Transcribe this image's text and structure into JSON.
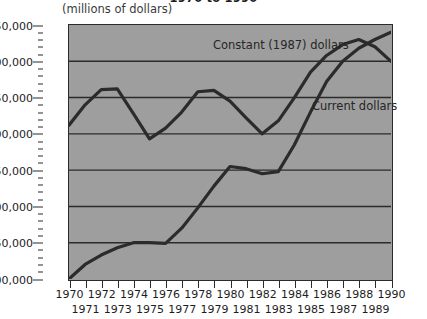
{
  "chart_data": {
    "type": "line",
    "title": "1970 to 1990",
    "subtitle": "(millions of dollars)",
    "xlabel": "",
    "ylabel": "",
    "grid": true,
    "legend_position": "inline-annotation",
    "x": [
      1970,
      1971,
      1972,
      1973,
      1974,
      1975,
      1976,
      1977,
      1978,
      1979,
      1980,
      1981,
      1982,
      1983,
      1984,
      1985,
      1986,
      1987,
      1988,
      1989,
      1990
    ],
    "xlim": [
      1970,
      1990
    ],
    "ylim": [
      100000,
      450000
    ],
    "ytick_values": [
      100000,
      150000,
      200000,
      250000,
      300000,
      350000,
      400000,
      450000
    ],
    "ytick_labels": [
      "$100,000",
      "$150,000",
      "$200,000",
      "$250,000",
      "$300,000",
      "$350,000",
      "$400,000",
      "$450,000"
    ],
    "ytick_minor_step": 10000,
    "xtick_labels_row_a": [
      "1970",
      "1972",
      "1974",
      "1976",
      "1978",
      "1980",
      "1982",
      "1984",
      "1986",
      "1988",
      "1990"
    ],
    "xtick_labels_row_b": [
      "1971",
      "1973",
      "1975",
      "1977",
      "1979",
      "1981",
      "1983",
      "1985",
      "1987",
      "1989"
    ],
    "series": [
      {
        "name": "Constant (1987) dollars",
        "color": "#2b2b2b",
        "values": [
          312000,
          340000,
          361000,
          362000,
          328000,
          293000,
          308000,
          330000,
          358000,
          360000,
          345000,
          322000,
          300000,
          318000,
          350000,
          385000,
          408000,
          423000,
          430000,
          420000,
          400000
        ]
      },
      {
        "name": "Current dollars",
        "color": "#2b2b2b",
        "values": [
          100000,
          120000,
          133000,
          143000,
          150000,
          150000,
          149000,
          170000,
          198000,
          228000,
          255000,
          252000,
          245000,
          248000,
          285000,
          330000,
          372000,
          400000,
          418000,
          430000,
          440000
        ]
      }
    ],
    "annotations": [
      {
        "text": "Constant (1987) dollars",
        "near_x": 1979,
        "near_y": 440000
      },
      {
        "text": "Current dollars",
        "near_x": 1986,
        "near_y": 355000
      }
    ]
  },
  "colors": {
    "plot_background": "#9e9e9e",
    "axis": "#2b2b2b",
    "gridline": "#2b2b2b",
    "text": "#1d1d1d",
    "page_background": "#ffffff"
  }
}
